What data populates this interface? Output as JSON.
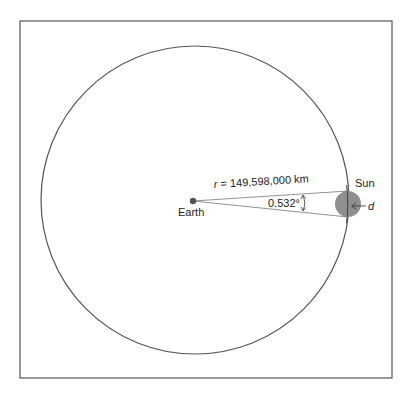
{
  "diagram": {
    "frame": {
      "stroke": "#555555"
    },
    "orbit_circle": {
      "stroke": "#555555"
    },
    "earth": {
      "label": "Earth",
      "color": "#555555"
    },
    "sun": {
      "label": "Sun",
      "color": "#8f8f8f"
    },
    "distance_label": {
      "var": "r",
      "equals": " = 149,598,000 km"
    },
    "angle_label": "0.532°",
    "diameter_label": "d",
    "caption_partial": "Figure"
  }
}
